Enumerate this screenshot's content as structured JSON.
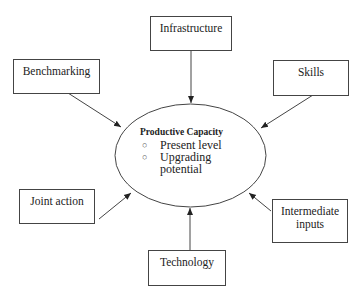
{
  "diagram": {
    "center": {
      "title": "Productive Capacity",
      "bullets": [
        "Present level",
        "Upgrading potential"
      ],
      "bullet_lines": [
        [
          "Present level"
        ],
        [
          "Upgrading",
          "potential"
        ]
      ],
      "bullet_icon": "hollow-circle-bullet"
    },
    "nodes": [
      {
        "id": "infrastructure",
        "label": "Infrastructure"
      },
      {
        "id": "skills",
        "label": "Skills"
      },
      {
        "id": "benchmarking",
        "label": "Benchmarking"
      },
      {
        "id": "joint-action",
        "label": "Joint action"
      },
      {
        "id": "intermediate-inputs",
        "label": "Intermediate inputs",
        "lines": [
          "Intermediate",
          "inputs"
        ]
      },
      {
        "id": "technology",
        "label": "Technology"
      }
    ],
    "edges": [
      {
        "from": "infrastructure",
        "to": "center"
      },
      {
        "from": "skills",
        "to": "center"
      },
      {
        "from": "benchmarking",
        "to": "center"
      },
      {
        "from": "joint-action",
        "to": "center"
      },
      {
        "from": "intermediate-inputs",
        "to": "center"
      },
      {
        "from": "technology",
        "to": "center"
      }
    ],
    "colors": {
      "stroke": "#444444",
      "text": "#222222",
      "background": "#ffffff"
    }
  }
}
